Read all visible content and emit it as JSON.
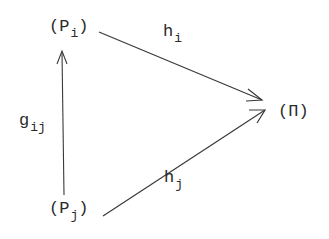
{
  "diagram": {
    "type": "commutative-diagram",
    "nodes": {
      "pi": {
        "open": "(",
        "base": "P",
        "sub": "i",
        "close": ")"
      },
      "pj": {
        "open": "(",
        "base": "P",
        "sub": "j",
        "close": ")"
      },
      "target": {
        "label": "(Π)"
      }
    },
    "edges": {
      "g": {
        "base": "g",
        "sub": "ij",
        "from": "pj",
        "to": "pi"
      },
      "hi": {
        "base": "h",
        "sub": "i",
        "from": "pi",
        "to": "target"
      },
      "hj": {
        "base": "h",
        "sub": "j",
        "from": "pj",
        "to": "target"
      }
    },
    "colors": {
      "ink": "#2a2a2a",
      "background": "#ffffff"
    }
  }
}
